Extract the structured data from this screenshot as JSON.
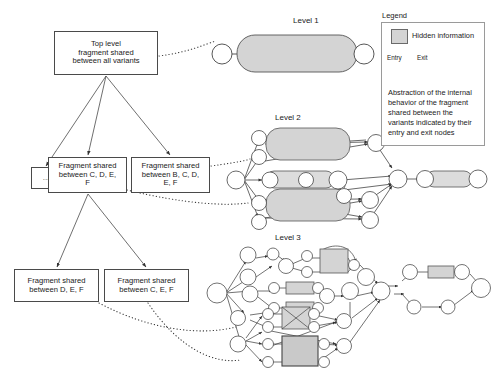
{
  "diagram": {
    "colors": {
      "hidden_fill": "#d4d4d4",
      "node_stroke": "#444444",
      "box_stroke": "#4a4a4a",
      "dotted_link": "#333333",
      "background": "#ffffff"
    }
  },
  "tree": {
    "nodes": [
      {
        "id": "top",
        "label": "Top level\nfragment shared\nbetween all variants"
      },
      {
        "id": "dash",
        "label": "..."
      },
      {
        "id": "cdef",
        "label": "Fragment shared\nbetween C, D, E,\nF"
      },
      {
        "id": "bcdef",
        "label": "Fragment shared\nbetween B, C, D,\nE, F"
      },
      {
        "id": "def",
        "label": "Fragment shared\nbetween D, E, F"
      },
      {
        "id": "cef",
        "label": "Fragment shared\nbetween C, E, F"
      }
    ],
    "box_top_line1": "Top level",
    "box_top_line2": "fragment shared",
    "box_top_line3": "between all variants",
    "box_dash_label": "...",
    "box_cdef_line1": "Fragment shared",
    "box_cdef_line2": "between C, D, E,",
    "box_cdef_line3": "F",
    "box_bcdef_line1": "Fragment shared",
    "box_bcdef_line2": "between B, C, D,",
    "box_bcdef_line3": "E, F",
    "box_def_line1": "Fragment shared",
    "box_def_line2": "between D, E, F",
    "box_cef_line1": "Fragment shared",
    "box_cef_line2": "between C, E, F"
  },
  "levels": {
    "level1_label": "Level 1",
    "level2_label": "Level 2",
    "level3_label": "Level 3"
  },
  "legend": {
    "title": "Legend",
    "hidden_information_label": "Hidden information",
    "entry_label": "Entry",
    "exit_label": "Exit",
    "description": "Abstraction of the internal behavior of the fragment shared between the variants indicated by their entry and exit nodes"
  }
}
